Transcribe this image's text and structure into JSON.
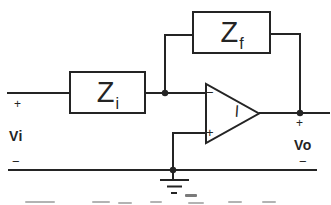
{
  "diagram": {
    "type": "inverting-opamp-amplifier-circuit",
    "impedances": {
      "feedback": {
        "symbol": "Z",
        "subscript": "f"
      },
      "input": {
        "symbol": "Z",
        "subscript": "i"
      }
    },
    "opamp": {
      "inverting_input_sign": "−",
      "noninverting_input_sign": "+",
      "inner_mark": "l"
    },
    "terminals": {
      "input_label": "Vi",
      "input_plus": "+",
      "input_minus": "−",
      "output_label": "Vo",
      "output_plus": "+",
      "output_minus": "−"
    },
    "colors": {
      "line": "#242424",
      "background": "#ffffff"
    }
  }
}
